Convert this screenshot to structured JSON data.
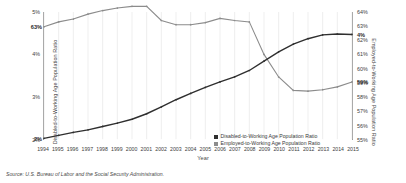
{
  "chart_data": {
    "type": "line",
    "title": "",
    "xlabel": "Year",
    "ylabel_left": "Disabled-to-Working Age Population Ratio",
    "ylabel_right": "Employed-to-Working Age Population Ratio",
    "x": [
      1994,
      1995,
      1996,
      1997,
      1998,
      1999,
      2000,
      2001,
      2002,
      2003,
      2004,
      2005,
      2006,
      2007,
      2008,
      2009,
      2010,
      2011,
      2012,
      2013,
      2014,
      2015
    ],
    "categories": [
      "1994",
      "1995",
      "1996",
      "1997",
      "1998",
      "1999",
      "2000",
      "2001",
      "2002",
      "2003",
      "2004",
      "2005",
      "2006",
      "2007",
      "2008",
      "2009",
      "2010",
      "2011",
      "2012",
      "2013",
      "2014",
      "2015"
    ],
    "ylim_left": [
      2,
      5
    ],
    "ylim_right": [
      55,
      64
    ],
    "yticks_left": [
      "5%",
      "4%",
      "3%",
      "2%"
    ],
    "yticks_left_values": [
      5,
      4,
      3,
      2
    ],
    "yticks_right": [
      "64%",
      "63%",
      "62%",
      "61%",
      "60%",
      "59%",
      "58%",
      "57%",
      "56%",
      "55%"
    ],
    "yticks_right_values": [
      64,
      63,
      62,
      61,
      60,
      59,
      58,
      57,
      56,
      55
    ],
    "grid": "vertical",
    "legend_position": "bottom-center",
    "series": [
      {
        "name": "Disabled-to-Working Age Population Ratio",
        "axis": "left",
        "color": "#2f2f2f",
        "values": [
          2.02,
          2.09,
          2.16,
          2.22,
          2.3,
          2.38,
          2.47,
          2.6,
          2.76,
          2.93,
          3.08,
          3.22,
          3.35,
          3.47,
          3.62,
          3.84,
          4.06,
          4.24,
          4.37,
          4.46,
          4.48,
          4.47
        ]
      },
      {
        "name": "Employed-to-Working Age Population Ratio",
        "axis": "right",
        "color": "#8c8c8c",
        "values": [
          62.95,
          63.3,
          63.5,
          63.85,
          64.1,
          64.28,
          64.4,
          64.4,
          63.4,
          63.1,
          63.1,
          63.25,
          63.55,
          63.4,
          63.3,
          61.0,
          59.4,
          58.45,
          58.4,
          58.5,
          58.7,
          59.05
        ]
      }
    ],
    "point_labels": [
      {
        "text": "63%",
        "series": "Employed-to-Working Age Population Ratio",
        "at": "start"
      },
      {
        "text": "2%",
        "series": "Disabled-to-Working Age Population Ratio",
        "at": "start"
      },
      {
        "text": "4%",
        "series": "Disabled-to-Working Age Population Ratio",
        "at": "end"
      },
      {
        "text": "59%",
        "series": "Employed-to-Working Age Population Ratio",
        "at": "end"
      }
    ]
  },
  "legend": {
    "items": [
      {
        "label": "Disabled-to-Working Age Population Ratio",
        "color": "#2f2f2f"
      },
      {
        "label": "Employed-to-Working Age Population Ratio",
        "color": "#8c8c8c"
      }
    ]
  },
  "labels": {
    "left_axis_title": "Disabled-to-Working Age Population Ratio",
    "right_axis_title": "Employed-to-Working Age Population Ratio",
    "x_axis_title": "Year",
    "label_start_gray": "63%",
    "label_start_dark": "2%",
    "label_end_dark": "4%",
    "label_end_gray": "59%"
  },
  "source": {
    "text": "Source: U.S. Bureau of Labor and the Social Security Administration."
  }
}
